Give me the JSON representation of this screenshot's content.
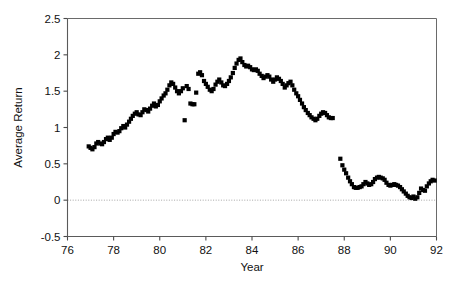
{
  "chart_data": {
    "type": "scatter",
    "title": "",
    "xlabel": "Year",
    "ylabel": "Average Return",
    "xlim": [
      76,
      92
    ],
    "ylim": [
      -0.5,
      2.5
    ],
    "xticks": [
      76,
      78,
      80,
      82,
      84,
      86,
      88,
      90,
      92
    ],
    "xticklabels": [
      "76",
      "78",
      "80",
      "82",
      "84",
      "86",
      "88",
      "90",
      "92"
    ],
    "yticks": [
      -0.5,
      0,
      0.5,
      1,
      1.5,
      2,
      2.5
    ],
    "yticklabels": [
      "-0.5",
      "0",
      "0.5",
      "1",
      "1.5",
      "2",
      "2.5"
    ],
    "grid": false,
    "zero_reference_line": 0,
    "marker": "square",
    "marker_color": "#000000",
    "marker_size": 4.2,
    "series": [
      {
        "name": "Average Return",
        "points": [
          [
            76.92,
            0.74
          ],
          [
            77.0,
            0.72
          ],
          [
            77.08,
            0.7
          ],
          [
            77.17,
            0.73
          ],
          [
            77.25,
            0.78
          ],
          [
            77.33,
            0.8
          ],
          [
            77.42,
            0.78
          ],
          [
            77.5,
            0.77
          ],
          [
            77.58,
            0.8
          ],
          [
            77.67,
            0.84
          ],
          [
            77.75,
            0.86
          ],
          [
            77.83,
            0.83
          ],
          [
            77.92,
            0.86
          ],
          [
            78.0,
            0.91
          ],
          [
            78.08,
            0.94
          ],
          [
            78.17,
            0.93
          ],
          [
            78.25,
            0.95
          ],
          [
            78.33,
            0.99
          ],
          [
            78.42,
            1.02
          ],
          [
            78.5,
            1.0
          ],
          [
            78.58,
            1.04
          ],
          [
            78.67,
            1.08
          ],
          [
            78.75,
            1.12
          ],
          [
            78.83,
            1.16
          ],
          [
            78.92,
            1.19
          ],
          [
            79.0,
            1.21
          ],
          [
            79.08,
            1.18
          ],
          [
            79.17,
            1.17
          ],
          [
            79.25,
            1.21
          ],
          [
            79.33,
            1.25
          ],
          [
            79.42,
            1.24
          ],
          [
            79.5,
            1.22
          ],
          [
            79.58,
            1.26
          ],
          [
            79.67,
            1.3
          ],
          [
            79.75,
            1.33
          ],
          [
            79.83,
            1.29
          ],
          [
            79.92,
            1.31
          ],
          [
            80.0,
            1.36
          ],
          [
            80.08,
            1.4
          ],
          [
            80.17,
            1.44
          ],
          [
            80.25,
            1.47
          ],
          [
            80.33,
            1.52
          ],
          [
            80.42,
            1.58
          ],
          [
            80.5,
            1.62
          ],
          [
            80.58,
            1.6
          ],
          [
            80.67,
            1.55
          ],
          [
            80.75,
            1.5
          ],
          [
            80.83,
            1.47
          ],
          [
            80.92,
            1.5
          ],
          [
            81.0,
            1.54
          ],
          [
            81.08,
            1.1
          ],
          [
            81.17,
            1.57
          ],
          [
            81.25,
            1.53
          ],
          [
            81.33,
            1.33
          ],
          [
            81.42,
            1.32
          ],
          [
            81.5,
            1.32
          ],
          [
            81.58,
            1.48
          ],
          [
            81.67,
            1.74
          ],
          [
            81.75,
            1.76
          ],
          [
            81.83,
            1.72
          ],
          [
            81.92,
            1.64
          ],
          [
            82.0,
            1.6
          ],
          [
            82.08,
            1.56
          ],
          [
            82.17,
            1.52
          ],
          [
            82.25,
            1.5
          ],
          [
            82.33,
            1.53
          ],
          [
            82.42,
            1.59
          ],
          [
            82.5,
            1.63
          ],
          [
            82.58,
            1.66
          ],
          [
            82.67,
            1.62
          ],
          [
            82.75,
            1.58
          ],
          [
            82.83,
            1.57
          ],
          [
            82.92,
            1.6
          ],
          [
            83.0,
            1.64
          ],
          [
            83.08,
            1.69
          ],
          [
            83.17,
            1.75
          ],
          [
            83.25,
            1.82
          ],
          [
            83.33,
            1.88
          ],
          [
            83.42,
            1.93
          ],
          [
            83.5,
            1.95
          ],
          [
            83.58,
            1.9
          ],
          [
            83.67,
            1.86
          ],
          [
            83.75,
            1.84
          ],
          [
            83.83,
            1.85
          ],
          [
            83.92,
            1.83
          ],
          [
            84.0,
            1.8
          ],
          [
            84.08,
            1.79
          ],
          [
            84.17,
            1.8
          ],
          [
            84.25,
            1.78
          ],
          [
            84.33,
            1.74
          ],
          [
            84.42,
            1.71
          ],
          [
            84.5,
            1.68
          ],
          [
            84.58,
            1.7
          ],
          [
            84.67,
            1.72
          ],
          [
            84.75,
            1.7
          ],
          [
            84.83,
            1.66
          ],
          [
            84.92,
            1.63
          ],
          [
            85.0,
            1.66
          ],
          [
            85.08,
            1.69
          ],
          [
            85.17,
            1.67
          ],
          [
            85.25,
            1.64
          ],
          [
            85.33,
            1.6
          ],
          [
            85.42,
            1.55
          ],
          [
            85.5,
            1.58
          ],
          [
            85.58,
            1.61
          ],
          [
            85.67,
            1.63
          ],
          [
            85.75,
            1.58
          ],
          [
            85.83,
            1.52
          ],
          [
            85.92,
            1.47
          ],
          [
            86.0,
            1.43
          ],
          [
            86.08,
            1.38
          ],
          [
            86.17,
            1.33
          ],
          [
            86.25,
            1.28
          ],
          [
            86.33,
            1.24
          ],
          [
            86.42,
            1.2
          ],
          [
            86.5,
            1.17
          ],
          [
            86.58,
            1.14
          ],
          [
            86.67,
            1.12
          ],
          [
            86.75,
            1.1
          ],
          [
            86.83,
            1.12
          ],
          [
            86.92,
            1.16
          ],
          [
            87.0,
            1.19
          ],
          [
            87.08,
            1.21
          ],
          [
            87.17,
            1.2
          ],
          [
            87.25,
            1.17
          ],
          [
            87.33,
            1.14
          ],
          [
            87.42,
            1.13
          ],
          [
            87.5,
            1.13
          ],
          [
            87.83,
            0.57
          ],
          [
            87.92,
            0.48
          ],
          [
            88.0,
            0.42
          ],
          [
            88.08,
            0.37
          ],
          [
            88.17,
            0.31
          ],
          [
            88.25,
            0.26
          ],
          [
            88.33,
            0.22
          ],
          [
            88.42,
            0.18
          ],
          [
            88.5,
            0.17
          ],
          [
            88.58,
            0.17
          ],
          [
            88.67,
            0.18
          ],
          [
            88.75,
            0.19
          ],
          [
            88.83,
            0.22
          ],
          [
            88.92,
            0.25
          ],
          [
            89.0,
            0.23
          ],
          [
            89.08,
            0.21
          ],
          [
            89.17,
            0.22
          ],
          [
            89.25,
            0.25
          ],
          [
            89.33,
            0.29
          ],
          [
            89.42,
            0.31
          ],
          [
            89.5,
            0.32
          ],
          [
            89.58,
            0.31
          ],
          [
            89.67,
            0.3
          ],
          [
            89.75,
            0.28
          ],
          [
            89.83,
            0.24
          ],
          [
            89.92,
            0.21
          ],
          [
            90.0,
            0.2
          ],
          [
            90.08,
            0.21
          ],
          [
            90.17,
            0.22
          ],
          [
            90.25,
            0.21
          ],
          [
            90.33,
            0.2
          ],
          [
            90.42,
            0.18
          ],
          [
            90.5,
            0.15
          ],
          [
            90.58,
            0.12
          ],
          [
            90.67,
            0.09
          ],
          [
            90.75,
            0.06
          ],
          [
            90.83,
            0.04
          ],
          [
            90.92,
            0.03
          ],
          [
            91.0,
            0.05
          ],
          [
            91.08,
            0.02
          ],
          [
            91.17,
            0.04
          ],
          [
            91.25,
            0.1
          ],
          [
            91.33,
            0.16
          ],
          [
            91.42,
            0.14
          ],
          [
            91.5,
            0.13
          ],
          [
            91.58,
            0.19
          ],
          [
            91.67,
            0.23
          ],
          [
            91.75,
            0.26
          ],
          [
            91.83,
            0.28
          ],
          [
            91.92,
            0.27
          ]
        ]
      }
    ]
  },
  "axes": {
    "x_title": "Year",
    "y_title": "Average Return"
  }
}
